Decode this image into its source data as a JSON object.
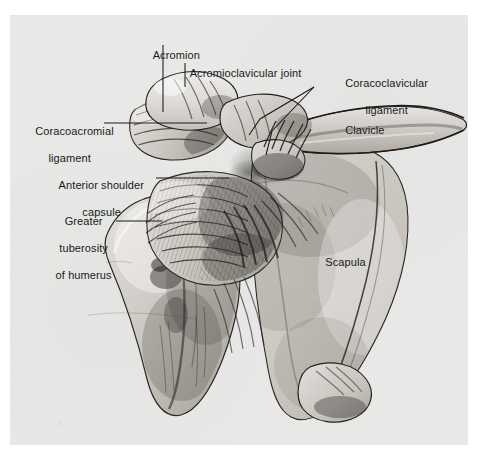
{
  "figure": {
    "kind": "anatomical-illustration",
    "medium": "halftone pencil/wash drawing scanned from a printed page",
    "plate_background_color": "#e9e9e8",
    "page_background_color": "#ffffff",
    "ink_color": "#1a1a1a",
    "leader_line_color": "#1a1a1a"
  },
  "labels": {
    "acromion": "Acromion",
    "acromioclavicular_joint": "Acromioclavicular joint",
    "coracoclavicular_ligament_line1": "Coracoclavicular",
    "coracoclavicular_ligament_line2": "ligament",
    "coracoacromial_ligament_line1": "Coracoacromial",
    "coracoacromial_ligament_line2": "ligament",
    "clavicle": "Clavicle",
    "anterior_shoulder_capsule_line1": "Anterior shoulder",
    "anterior_shoulder_capsule_line2": "capsule",
    "greater_tuberosity_line1": "Greater",
    "greater_tuberosity_line2": "tuberosity",
    "greater_tuberosity_line3": "of humerus",
    "scapula": "Scapula"
  },
  "structures": [
    {
      "name": "Acromion",
      "kind": "bone-process"
    },
    {
      "name": "Acromioclavicular joint",
      "kind": "joint"
    },
    {
      "name": "Coracoclavicular ligament",
      "kind": "ligament",
      "leader_count": 2
    },
    {
      "name": "Coracoacromial ligament",
      "kind": "ligament"
    },
    {
      "name": "Clavicle",
      "kind": "bone"
    },
    {
      "name": "Anterior shoulder capsule",
      "kind": "capsule"
    },
    {
      "name": "Greater tuberosity of humerus",
      "kind": "bone-landmark"
    },
    {
      "name": "Scapula",
      "kind": "bone"
    }
  ]
}
